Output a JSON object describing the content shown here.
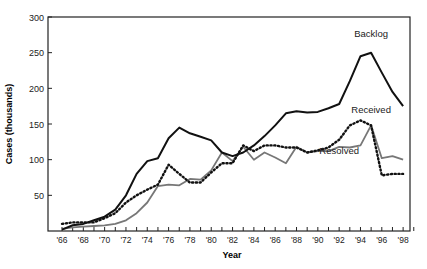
{
  "chart_data": {
    "type": "line",
    "title": "",
    "xlabel": "Year",
    "ylabel": "Cases (thousands)",
    "ylim": [
      0,
      300
    ],
    "xlim": [
      1966,
      1999
    ],
    "grid": false,
    "legend": "inline labels",
    "yticks": [
      50,
      100,
      150,
      200,
      250,
      300
    ],
    "xtick_labels": [
      "'66",
      "'68",
      "'70",
      "'72",
      "'74",
      "'76",
      "'78",
      "'80",
      "'82",
      "'84",
      "'86",
      "'88",
      "'90",
      "'92",
      "'94",
      "'96",
      "'98"
    ],
    "x": [
      1966,
      1967,
      1968,
      1969,
      1970,
      1971,
      1972,
      1973,
      1974,
      1975,
      1976,
      1977,
      1978,
      1979,
      1980,
      1981,
      1982,
      1983,
      1984,
      1985,
      1986,
      1987,
      1988,
      1989,
      1990,
      1991,
      1992,
      1993,
      1994,
      1995,
      1996,
      1997,
      1998
    ],
    "series": [
      {
        "name": "Backlog",
        "style": "solid-black",
        "values": [
          2,
          8,
          10,
          15,
          20,
          30,
          50,
          80,
          98,
          102,
          130,
          145,
          137,
          132,
          127,
          110,
          105,
          110,
          120,
          133,
          148,
          165,
          168,
          166,
          167,
          172,
          178,
          210,
          245,
          250,
          222,
          195,
          175
        ]
      },
      {
        "name": "Received",
        "style": "dotted-black",
        "values": [
          10,
          12,
          12,
          12,
          18,
          25,
          40,
          50,
          58,
          65,
          93,
          80,
          68,
          68,
          82,
          95,
          95,
          120,
          112,
          120,
          120,
          117,
          117,
          110,
          113,
          117,
          128,
          148,
          155,
          148,
          78,
          80,
          80
        ]
      },
      {
        "name": "Resolved",
        "style": "solid-gray",
        "values": [
          3,
          5,
          6,
          7,
          8,
          10,
          15,
          25,
          40,
          63,
          65,
          64,
          73,
          72,
          85,
          110,
          98,
          118,
          100,
          110,
          103,
          95,
          118,
          110,
          112,
          112,
          118,
          117,
          120,
          148,
          102,
          105,
          100
        ]
      }
    ],
    "annotations": [
      {
        "text": "Backlog",
        "x": 1995,
        "y": 272
      },
      {
        "text": "Received",
        "x": 1995,
        "y": 166
      },
      {
        "text": "Resolved",
        "x": 1992,
        "y": 108
      }
    ]
  }
}
